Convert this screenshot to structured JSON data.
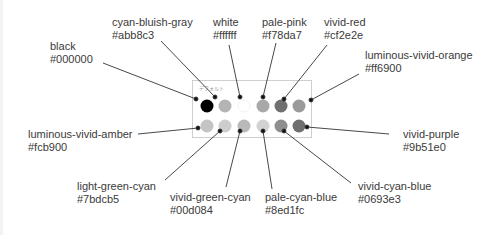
{
  "palette": {
    "title": "デフォルト",
    "swatches": [
      {
        "name": "black",
        "hex": "#000000",
        "display": "#000000",
        "row": 1,
        "col": 1
      },
      {
        "name": "cyan-bluish-gray",
        "hex": "#abb8c3",
        "display": "#b4b4b4",
        "row": 1,
        "col": 2
      },
      {
        "name": "white",
        "hex": "#ffffff",
        "display": "#ffffff",
        "row": 1,
        "col": 3
      },
      {
        "name": "pale-pink",
        "hex": "#f78da7",
        "display": "#a8a8a8",
        "row": 1,
        "col": 4
      },
      {
        "name": "vivid-red",
        "hex": "#cf2e2e",
        "display": "#707070",
        "row": 1,
        "col": 5
      },
      {
        "name": "luminous-vivid-orange",
        "hex": "#ff6900",
        "display": "#9a9a9a",
        "row": 1,
        "col": 6
      },
      {
        "name": "luminous-vivid-amber",
        "hex": "#fcb900",
        "display": "#c4c4c4",
        "row": 2,
        "col": 1
      },
      {
        "name": "light-green-cyan",
        "hex": "#7bdcb5",
        "display": "#cdcdcd",
        "row": 2,
        "col": 2
      },
      {
        "name": "vivid-green-cyan",
        "hex": "#00d084",
        "display": "#b9b9b9",
        "row": 2,
        "col": 3
      },
      {
        "name": "pale-cyan-blue",
        "hex": "#8ed1fc",
        "display": "#d2d2d2",
        "row": 2,
        "col": 4
      },
      {
        "name": "vivid-cyan-blue",
        "hex": "#0693e3",
        "display": "#8e8e8e",
        "row": 2,
        "col": 5
      },
      {
        "name": "vivid-purple",
        "hex": "#9b51e0",
        "display": "#6f6f6f",
        "row": 2,
        "col": 6
      }
    ]
  },
  "callouts": {
    "black": {
      "name": "black",
      "hex": "#000000"
    },
    "cyan_bluish_gray": {
      "name": "cyan-bluish-gray",
      "hex": "#abb8c3"
    },
    "white": {
      "name": "white",
      "hex": "#ffffff"
    },
    "pale_pink": {
      "name": "pale-pink",
      "hex": "#f78da7"
    },
    "vivid_red": {
      "name": "vivid-red",
      "hex": "#cf2e2e"
    },
    "luminous_vivid_orange": {
      "name": "luminous-vivid-orange",
      "hex": "#ff6900"
    },
    "luminous_vivid_amber": {
      "name": "luminous-vivid-amber",
      "hex": "#fcb900"
    },
    "light_green_cyan": {
      "name": "light-green-cyan",
      "hex": "#7bdcb5"
    },
    "vivid_green_cyan": {
      "name": "vivid-green-cyan",
      "hex": "#00d084"
    },
    "pale_cyan_blue": {
      "name": "pale-cyan-blue",
      "hex": "#8ed1fc"
    },
    "vivid_cyan_blue": {
      "name": "vivid-cyan-blue",
      "hex": "#0693e3"
    },
    "vivid_purple": {
      "name": "vivid-purple",
      "hex": "#9b51e0"
    }
  }
}
